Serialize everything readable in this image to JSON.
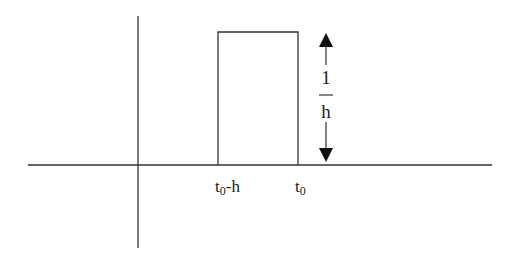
{
  "diagram": {
    "type": "rectangular-pulse",
    "colors": {
      "line": "#333333",
      "text": "#222222",
      "background": "#ffffff"
    },
    "axes": {
      "horizontal": {
        "x1": 28,
        "x2": 492,
        "y": 165
      },
      "vertical": {
        "x": 138,
        "y1": 16,
        "y2": 248
      }
    },
    "pulse": {
      "left": 218,
      "right": 298,
      "top": 32,
      "baseline": 165
    },
    "labels": {
      "left_edge": {
        "base": "t",
        "subscript": "0",
        "suffix": "-h"
      },
      "right_edge": {
        "base": "t",
        "subscript": "0",
        "suffix": ""
      }
    },
    "height_annotation": {
      "numerator": "1",
      "denominator": "h",
      "x": 326,
      "arrow_top": 33,
      "arrow_bottom": 163,
      "icons": [
        "arrow-up-icon",
        "arrow-down-icon"
      ]
    }
  }
}
